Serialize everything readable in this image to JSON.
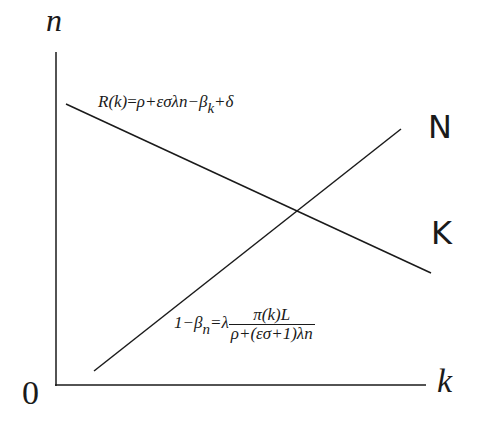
{
  "diagram": {
    "axes": {
      "y_label": "n",
      "x_label": "k",
      "origin_label": "0"
    },
    "curves": [
      {
        "name": "K",
        "label": "K",
        "description": "downward sloping line"
      },
      {
        "name": "N",
        "label": "N",
        "description": "upward sloping line"
      }
    ],
    "equations": {
      "K_curve": {
        "lhs": "R(k)",
        "rhs": "ρ+εσλn−β",
        "sub": "k",
        "tail": "+δ"
      },
      "N_curve": {
        "lhs": "1−β",
        "sub": "n",
        "eq": "=λ",
        "numerator": "π(k)L",
        "denominator": "ρ+(εσ+1)λn"
      }
    },
    "colors": {
      "line": "#1a1a1a",
      "background": "#ffffff"
    }
  }
}
